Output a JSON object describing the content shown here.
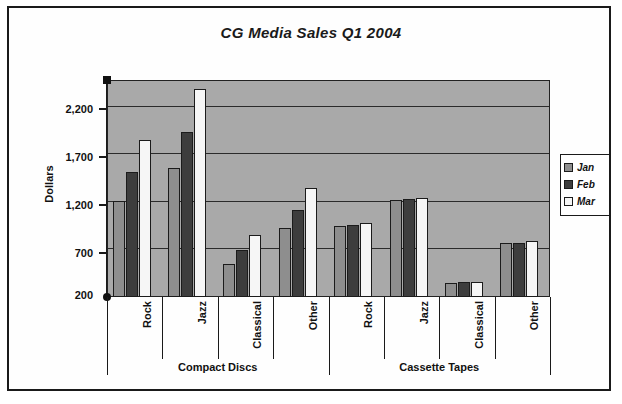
{
  "chart_data": {
    "type": "bar",
    "title": "CG Media Sales Q1 2004",
    "xlabel": "",
    "ylabel": "Dollars",
    "ylim": [
      200,
      2500
    ],
    "yticks": [
      "200",
      "700",
      "1,200",
      "1,700",
      "2,200"
    ],
    "grid": true,
    "legend_position": "right",
    "legend": [
      "Jan",
      "Feb",
      "Mar"
    ],
    "series_colors": [
      "#8e8e8e",
      "#3d3d3d",
      "#f6f6f6"
    ],
    "groups": [
      {
        "name": "Compact Discs",
        "categories": [
          "Rock",
          "Jazz",
          "Classical",
          "Other"
        ],
        "series": [
          {
            "name": "Jan",
            "values": [
              1220,
              1570,
              550,
              930
            ]
          },
          {
            "name": "Feb",
            "values": [
              1520,
              1950,
              700,
              1120
            ]
          },
          {
            "name": "Mar",
            "values": [
              1860,
              2400,
              860,
              1360
            ]
          }
        ]
      },
      {
        "name": "Cassette Tapes",
        "categories": [
          "Rock",
          "Jazz",
          "Classical",
          "Other"
        ],
        "series": [
          {
            "name": "Jan",
            "values": [
              950,
              1225,
              350,
              770
            ]
          },
          {
            "name": "Feb",
            "values": [
              965,
              1240,
              355,
              775
            ]
          },
          {
            "name": "Mar",
            "values": [
              980,
              1250,
              360,
              790
            ]
          }
        ]
      }
    ]
  },
  "chart": {
    "title": "CG Media Sales Q1 2004",
    "y_axis_title": "Dollars",
    "y_ticks": [
      "2,200",
      "1,700",
      "1,200",
      "700",
      "200"
    ],
    "legend_items": [
      {
        "label": "Jan",
        "color": "#8e8e8e"
      },
      {
        "label": "Feb",
        "color": "#3d3d3d"
      },
      {
        "label": "Mar",
        "color": "#f6f6f6"
      }
    ],
    "group_labels": [
      "Compact Discs",
      "Cassette Tapes"
    ],
    "category_labels": [
      "Rock",
      "Jazz",
      "Classical",
      "Other",
      "Rock",
      "Jazz",
      "Classical",
      "Other"
    ],
    "plot_background": "#a9a9a9",
    "border_color": "#1a1a1a"
  }
}
